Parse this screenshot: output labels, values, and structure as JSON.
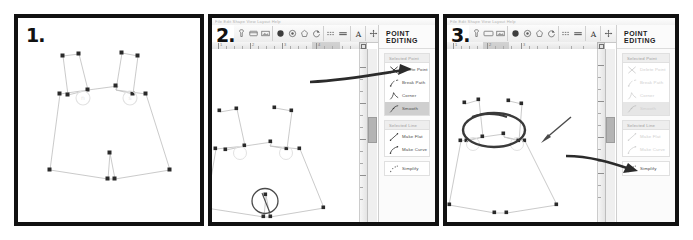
{
  "figure": {
    "panel_count": 3,
    "background": "#ffffff"
  },
  "panels": [
    {
      "step_label": "1.",
      "kind": "illustration-only",
      "description_visible": false
    },
    {
      "step_label": "2.",
      "kind": "app-screenshot",
      "menubar_text": "File  Edit  Shape  View  Layout  Help",
      "panel_title": "POINT EDITING",
      "ruler_numbers": [
        "1",
        "2",
        "3",
        "4"
      ],
      "sections": [
        {
          "section_label": "Selected Point",
          "items": [
            {
              "label": "Delete Point",
              "icon": "x-cross-icon",
              "state": "enabled"
            },
            {
              "label": "Break Path",
              "icon": "break-path-icon",
              "state": "enabled"
            },
            {
              "label": "Corner",
              "icon": "corner-icon",
              "state": "enabled"
            },
            {
              "label": "Smooth",
              "icon": "smooth-icon",
              "state": "selected"
            }
          ]
        },
        {
          "section_label": "Selected Line",
          "items": [
            {
              "label": "Make Flat",
              "icon": "make-flat-icon",
              "state": "enabled"
            },
            {
              "label": "Make Curve",
              "icon": "make-curve-icon",
              "state": "enabled"
            }
          ]
        },
        {
          "section_label": "",
          "items": [
            {
              "label": "Simplify",
              "icon": "simplify-icon",
              "state": "enabled"
            }
          ]
        }
      ]
    },
    {
      "step_label": "3.",
      "kind": "app-screenshot",
      "menubar_text": "File  Edit  Shape  View  Layout  Help",
      "panel_title": "POINT EDITING",
      "ruler_numbers": [
        "1",
        "2",
        "3"
      ],
      "sections": [
        {
          "section_label": "Selected Point",
          "items": [
            {
              "label": "Delete Point",
              "icon": "x-cross-icon",
              "state": "disabled"
            },
            {
              "label": "Break Path",
              "icon": "break-path-icon",
              "state": "disabled"
            },
            {
              "label": "Corner",
              "icon": "corner-icon",
              "state": "disabled"
            },
            {
              "label": "Smooth",
              "icon": "smooth-icon",
              "state": "selected-disabled"
            }
          ]
        },
        {
          "section_label": "Selected Line",
          "items": [
            {
              "label": "Make Flat",
              "icon": "make-flat-icon",
              "state": "disabled"
            },
            {
              "label": "Make Curve",
              "icon": "make-curve-icon",
              "state": "disabled"
            }
          ]
        },
        {
          "section_label": "",
          "items": [
            {
              "label": "Simplify",
              "icon": "simplify-icon",
              "state": "enabled"
            }
          ]
        }
      ]
    }
  ],
  "toolbar": {
    "groups": [
      {
        "name": "select-group",
        "buttons": [
          "pointer-select-icon",
          "rectangle-select-icon",
          "image-frame-icon"
        ]
      },
      {
        "name": "shape-group",
        "buttons": [
          "filled-polygon-icon",
          "gear-shape-icon",
          "pentagon-outline-icon",
          "rotate-shape-icon"
        ]
      },
      {
        "name": "line-group",
        "buttons": [
          "dashed-line-icon",
          "solid-line-icon"
        ]
      },
      {
        "name": "text-group",
        "buttons": [
          "text-tool-icon"
        ]
      },
      {
        "name": "transform-group",
        "buttons": [
          "move-icon",
          "rotate-icon",
          "reflect-icon",
          "pen-icon",
          "scissors-icon",
          "no-entry-icon",
          "ruler-icon"
        ]
      }
    ]
  },
  "colors": {
    "frame": "#111111",
    "canvas": "#ffffff",
    "chrome": "#f1f1f1",
    "selection_highlight": "#cfcfcf",
    "annotation": "#3b3b3b",
    "node": "#2a2a2a",
    "path": "#bdbdbd"
  },
  "annotations": [
    {
      "panel": 2,
      "type": "arrow",
      "points_to": "Delete Point"
    },
    {
      "panel": 2,
      "type": "circle-highlight",
      "target": "crotch-node-pair-on-canvas"
    },
    {
      "panel": 3,
      "type": "arrow",
      "points_to": "waist-right-node-on-canvas"
    },
    {
      "panel": 3,
      "type": "circle-highlight",
      "target": "waist-node-group-on-canvas"
    },
    {
      "panel": 3,
      "type": "arrow",
      "points_to": "Make Curve"
    }
  ]
}
